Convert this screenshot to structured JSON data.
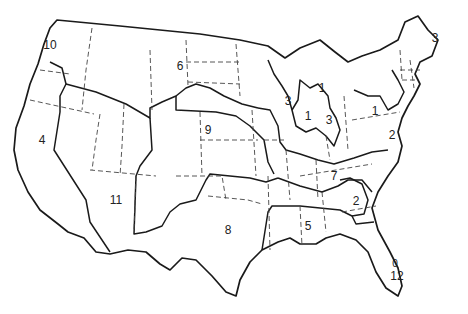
{
  "map": {
    "title": "",
    "type": "United States regional map",
    "labels": [
      {
        "id": "r10",
        "text": "10",
        "x": 50,
        "y": 45
      },
      {
        "id": "r4",
        "text": "4",
        "x": 42,
        "y": 140
      },
      {
        "id": "r6",
        "text": "6",
        "x": 180,
        "y": 66
      },
      {
        "id": "r9",
        "text": "9",
        "x": 208,
        "y": 130
      },
      {
        "id": "r11",
        "text": "11",
        "x": 116,
        "y": 200
      },
      {
        "id": "r8",
        "text": "8",
        "x": 228,
        "y": 230
      },
      {
        "id": "r5",
        "text": "5",
        "x": 308,
        "y": 226
      },
      {
        "id": "r2-south",
        "text": "2",
        "x": 356,
        "y": 201
      },
      {
        "id": "r12",
        "text": "12",
        "x": 397,
        "y": 276
      },
      {
        "id": "r12-dot",
        "text": "0",
        "x": 395,
        "y": 264,
        "small": true
      },
      {
        "id": "r7",
        "text": "7",
        "x": 334,
        "y": 176
      },
      {
        "id": "r2-east",
        "text": "2",
        "x": 392,
        "y": 135
      },
      {
        "id": "r1-east",
        "text": "1",
        "x": 375,
        "y": 111
      },
      {
        "id": "r3-mi",
        "text": "3",
        "x": 329,
        "y": 120
      },
      {
        "id": "r1-mi",
        "text": "1",
        "x": 308,
        "y": 116
      },
      {
        "id": "r3-wi",
        "text": "3",
        "x": 288,
        "y": 101
      },
      {
        "id": "r1-ohio",
        "text": "1",
        "x": 322,
        "y": 88
      },
      {
        "id": "r3-me",
        "text": "3",
        "x": 435,
        "y": 38
      }
    ]
  }
}
